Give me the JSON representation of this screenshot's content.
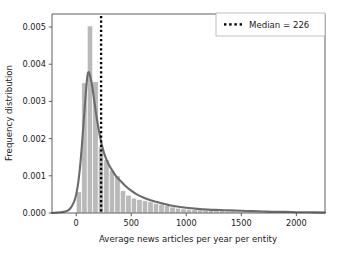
{
  "chart_data": {
    "type": "bar",
    "title": "",
    "xlabel": "Average news articles per year per entity",
    "ylabel": "Frequency distribution",
    "xlim": [
      -220,
      2260
    ],
    "ylim": [
      0.0,
      0.00535
    ],
    "xticks": [
      0,
      500,
      1000,
      1500,
      2000
    ],
    "xtick_labels": [
      "0",
      "500",
      "1000",
      "1500",
      "2000"
    ],
    "yticks": [
      0.0,
      0.001,
      0.002,
      0.003,
      0.004,
      0.005
    ],
    "ytick_labels": [
      "0.000",
      "0.001",
      "0.002",
      "0.003",
      "0.004",
      "0.005"
    ],
    "grid": false,
    "bin_width": 50,
    "bar_color": "#b9b9b9",
    "bar_edge_color": "#ffffff",
    "kde_color": "#6b6b6b",
    "median_line_color": "#000000",
    "categories": [
      25,
      75,
      125,
      175,
      225,
      275,
      325,
      375,
      425,
      475,
      525,
      575,
      625,
      675,
      725,
      775,
      825,
      875,
      925,
      975,
      1025,
      1075,
      1125,
      1175,
      1225,
      1275,
      1325,
      1375,
      1425,
      1475,
      1525,
      1575,
      1625,
      1675,
      1725,
      1775,
      1825,
      1875,
      1925,
      1975,
      2025,
      2075,
      2125,
      2175
    ],
    "values": [
      0.00057,
      0.0035,
      0.00503,
      0.00353,
      0.00178,
      0.00143,
      0.00115,
      0.001,
      0.0006,
      0.00048,
      0.0004,
      0.00036,
      0.00033,
      0.0003,
      0.00026,
      0.00022,
      0.0002,
      0.00016,
      0.00013,
      0.00011,
      0.0001,
      9e-05,
      8e-05,
      7e-05,
      7e-05,
      6e-05,
      6e-05,
      5e-05,
      5e-05,
      4e-05,
      4e-05,
      4e-05,
      3e-05,
      3e-05,
      3e-05,
      2e-05,
      2e-05,
      2e-05,
      2e-05,
      2e-05,
      1e-05,
      1e-05,
      1e-05,
      1e-05
    ],
    "series": [
      {
        "name": "kde",
        "type": "line",
        "x": [
          -220,
          -180,
          -140,
          -100,
          -60,
          -20,
          0,
          20,
          40,
          60,
          80,
          100,
          110,
          120,
          140,
          160,
          180,
          200,
          220,
          240,
          260,
          280,
          300,
          320,
          350,
          380,
          410,
          450,
          500,
          550,
          600,
          650,
          700,
          750,
          800,
          850,
          900,
          1000,
          1100,
          1200,
          1300,
          1400,
          1500,
          1600,
          1700,
          1800,
          1900,
          2000,
          2100,
          2260
        ],
        "y": [
          0.0,
          1e-05,
          2e-05,
          4e-05,
          0.0001,
          0.0003,
          0.0005,
          0.00085,
          0.0014,
          0.00215,
          0.00295,
          0.00365,
          0.00378,
          0.00375,
          0.0035,
          0.0031,
          0.00268,
          0.00232,
          0.002,
          0.00175,
          0.00155,
          0.0014,
          0.00128,
          0.00118,
          0.00104,
          0.00093,
          0.00084,
          0.00072,
          0.0006,
          0.0005,
          0.00043,
          0.00037,
          0.00032,
          0.00028,
          0.00024,
          0.00021,
          0.00018,
          0.00014,
          0.00011,
          9e-05,
          8e-05,
          7e-05,
          6e-05,
          5e-05,
          4e-05,
          3e-05,
          3e-05,
          2e-05,
          2e-05,
          1e-05
        ]
      }
    ],
    "annotations": [
      {
        "name": "median",
        "value": 226,
        "label": "Median = 226",
        "style": "dotted-vertical-line"
      }
    ],
    "legend": {
      "position": "upper right",
      "entries": [
        {
          "label": "Median = 226",
          "marker": "dotted-line",
          "color": "#000000"
        }
      ]
    }
  }
}
